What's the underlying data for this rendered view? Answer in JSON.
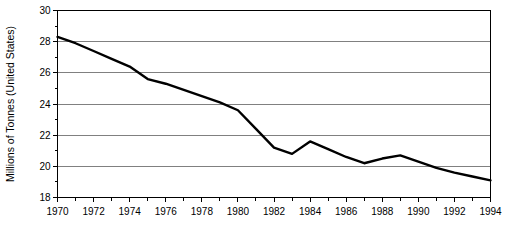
{
  "chart_data": {
    "type": "line",
    "title": "",
    "subtitle": "",
    "xlabel": "",
    "ylabel": "Millions of Tonnes (United States)",
    "x": [
      1970,
      1971,
      1972,
      1973,
      1974,
      1975,
      1976,
      1977,
      1978,
      1979,
      1980,
      1981,
      1982,
      1983,
      1984,
      1985,
      1986,
      1987,
      1988,
      1989,
      1990,
      1991,
      1992,
      1993,
      1994
    ],
    "values": [
      28.3,
      27.9,
      27.4,
      26.9,
      26.4,
      25.6,
      25.3,
      24.9,
      24.5,
      24.1,
      23.6,
      22.4,
      21.2,
      20.8,
      21.6,
      21.1,
      20.6,
      20.2,
      20.5,
      20.7,
      20.3,
      19.9,
      19.6,
      19.35,
      19.1
    ],
    "series": [
      {
        "name": "United States",
        "values": [
          28.3,
          27.9,
          27.4,
          26.9,
          26.4,
          25.6,
          25.3,
          24.9,
          24.5,
          24.1,
          23.6,
          22.4,
          21.2,
          20.8,
          21.6,
          21.1,
          20.6,
          20.2,
          20.5,
          20.7,
          20.3,
          19.9,
          19.6,
          19.35,
          19.1
        ],
        "color": "#000000"
      }
    ],
    "xlim": [
      1970,
      1994
    ],
    "ylim": [
      18,
      30
    ],
    "x_tick_labels": [
      "1970",
      "1972",
      "1974",
      "1976",
      "1978",
      "1980",
      "1982",
      "1984",
      "1986",
      "1988",
      "1990",
      "1992",
      "1994"
    ],
    "x_tick_values": [
      1970,
      1972,
      1974,
      1976,
      1978,
      1980,
      1982,
      1984,
      1986,
      1988,
      1990,
      1992,
      1994
    ],
    "x_minor_tick_values": [
      1971,
      1973,
      1975,
      1977,
      1979,
      1981,
      1983,
      1985,
      1987,
      1989,
      1991,
      1993
    ],
    "y_tick_labels": [
      "30",
      "28",
      "26",
      "24",
      "22",
      "20",
      "18"
    ],
    "y_tick_values": [
      30,
      28,
      26,
      24,
      22,
      20,
      18
    ],
    "y_minor_tick_values": [
      29,
      27,
      25,
      23,
      21,
      19
    ],
    "grid": true,
    "grid_axis": "y",
    "legend": false,
    "legend_position": "none",
    "annotations": [],
    "colors": {
      "line": "#000000",
      "grid": "#808080",
      "frame": "#000000",
      "background": "#ffffff",
      "text": "#000000"
    }
  }
}
